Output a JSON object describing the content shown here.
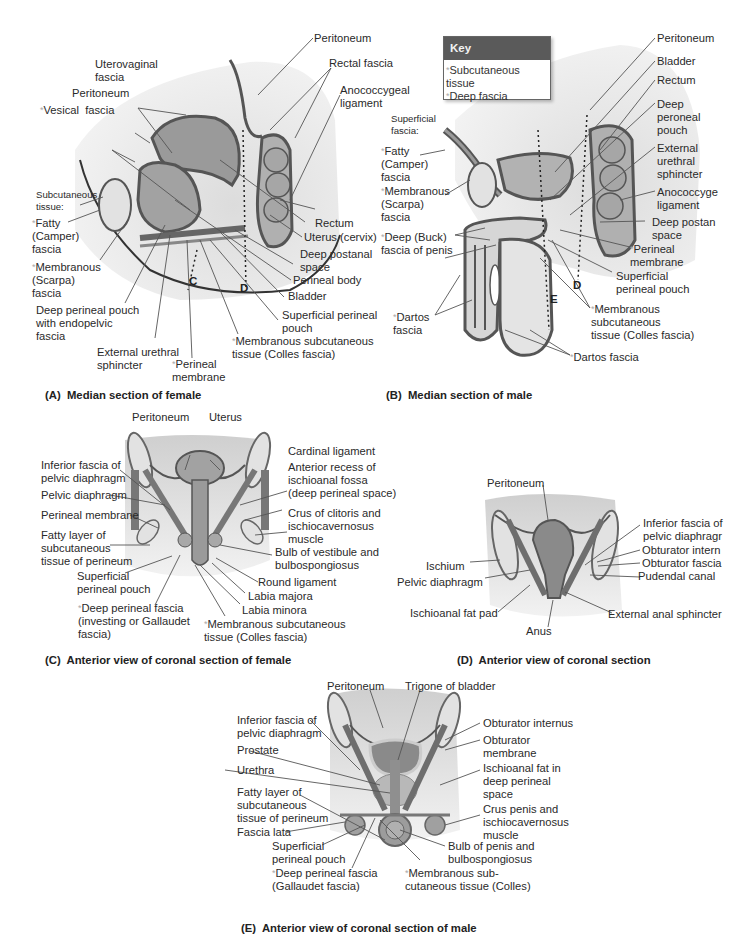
{
  "key": {
    "title": "Key",
    "items": [
      "Subcutaneous tissue",
      "Deep fascia"
    ],
    "header_color": "#5a5a5a",
    "asterisk_color": "#a8a8a8"
  },
  "panels": {
    "A": {
      "caption": "(A)  Median section of female",
      "labels": {
        "peritoneum_top": "Peritoneum",
        "uterovaginal_fascia": "Uterovaginal\nfascia",
        "rectal_fascia": "Rectal fascia",
        "peritoneum": "Peritoneum",
        "anococcygeal_ligament": "Anococcygeal\nligament",
        "vesical_fascia": "Vesical  fascia",
        "subcutaneous_tissue": "Subcutaneous\ntissue:",
        "fatty_camper": "Fatty\n(Camper)\nfascia",
        "membranous_scarpa": "Membranous\n(Scarpa)\nfascia",
        "deep_perineal_pouch": "Deep perineal pouch\nwith endopelvic\nfascia",
        "external_urethral_sphincter": "External urethral\nsphincter",
        "perineal_membrane": "Perineal\nmembrane",
        "membranous_subcutaneous": "Membranous subcutaneous\ntissue (Colles fascia)",
        "superficial_perineal_pouch": "Superficial perineal\npouch",
        "bladder": "Bladder",
        "perineal_body": "Perineal body",
        "deep_postanal_space": "Deep postanal\nspace",
        "uterus_cervix": "Uterus (cervix)",
        "rectum": "Rectum",
        "plane_c": "C",
        "plane_d": "D"
      }
    },
    "B": {
      "caption": "(B)  Median section of male",
      "labels": {
        "peritoneum": "Peritoneum",
        "bladder": "Bladder",
        "rectum": "Rectum",
        "deep_peroneal_pouch": "Deep\nperoneal\npouch",
        "external_urethral_sphincter": "External\nurethral\nsphincter",
        "anococcygeal_ligament": "Anococcyge\nligament",
        "deep_postanal_space": "Deep postan\nspace",
        "perineal_membrane": "Perineal\nmembrane",
        "superficial_perineal_pouch": "Superficial\nperineal pouch",
        "membranous_subcutaneous": "Membranous\nsubcutaneous\ntissue (Colles fascia)",
        "dartos_fascia_bottom": "Dartos fascia",
        "dartos_fascia_left": "Dartos\nfascia",
        "deep_buck_fascia": "Deep (Buck)\nfascia of penis",
        "membranous_scarpa": "Membranous\n(Scarpa)\nfascia",
        "fatty_camper": "Fatty\n(Camper)\nfascia",
        "superficial_fascia": "Superficial\nfascia:",
        "plane_d": "D",
        "plane_e": "E"
      }
    },
    "C": {
      "caption": "(C)  Anterior view of coronal section of female",
      "labels": {
        "peritoneum": "Peritoneum",
        "uterus": "Uterus",
        "cardinal_ligament": "Cardinal ligament",
        "anterior_recess": "Anterior recess of\nischioanal fossa\n(deep perineal space)",
        "crus_of_clitoris": "Crus of clitoris and\nischiocavernosus\nmuscle",
        "bulb_of_vestibule": "Bulb of vestibule and\nbulbospongiosus",
        "round_ligament": "Round ligament",
        "labia_majora": "Labia majora",
        "labia_minora": "Labia minora",
        "membranous_subcutaneous": "Membranous subcutaneous\ntissue (Colles fascia)",
        "deep_perineal_fascia": "Deep perineal fascia\n(investing or Gallaudet\nfascia)",
        "superficial_perineal_pouch": "Superficial\nperineal pouch",
        "fatty_layer": "Fatty layer of\nsubcutaneous\ntissue of perineum",
        "perineal_membrane": "Perineal membrane",
        "pelvic_diaphragm": "Pelvic diaphragm",
        "inferior_fascia": "Inferior fascia of\npelvic diaphragm"
      }
    },
    "D": {
      "caption": "(D)  Anterior view of coronal section",
      "labels": {
        "peritoneum": "Peritoneum",
        "inferior_fascia": "Inferior fascia of\npelvic diaphragr",
        "obturator_internus": "Obturator intern",
        "obturator_fascia": "Obturator fascia",
        "pudendal_canal": "Pudendal canal",
        "external_anal_sphincter": "External anal sphincter",
        "anus": "Anus",
        "ischioanal_fat_pad": "Ischioanal fat pad",
        "pelvic_diaphragm": "Pelvic diaphragm",
        "ischium": "Ischium"
      }
    },
    "E": {
      "caption": "(E)  Anterior view of coronal section of male",
      "labels": {
        "peritoneum": "Peritoneum",
        "trigone_of_bladder": "Trigone of bladder",
        "obturator_internus": "Obturator internus",
        "obturator_membrane": "Obturator\nmembrane",
        "ischioanal_fat": "Ischioanal fat in\ndeep perineal\nspace",
        "crus_penis": "Crus penis and\nischiocavernosus\nmuscle",
        "bulb_of_penis": "Bulb of penis and\nbulbospongiosus",
        "membranous_subcutaneous": "Membranous sub-\ncutaneous tissue (Colles)",
        "deep_perineal_fascia": "Deep perineal fascia\n(Gallaudet fascia)",
        "superficial_perineal_pouch": "Superficial\nperineal pouch",
        "fascia_lata": "Fascia lata",
        "fatty_layer": "Fatty layer of\nsubcutaneous\ntissue of perineum",
        "urethra": "Urethra",
        "prostate": "Prostate",
        "inferior_fascia": "Inferior fascia of\npelvic diaphragm"
      }
    }
  },
  "colors": {
    "tissue_fill": "#d2d2d2",
    "organ_fill": "#9a9a9a",
    "wall_stroke": "#5c5c5c",
    "background_shade": "#e6e6e6",
    "bone_fill": "#e2e2e2",
    "leader_line": "#555555"
  }
}
